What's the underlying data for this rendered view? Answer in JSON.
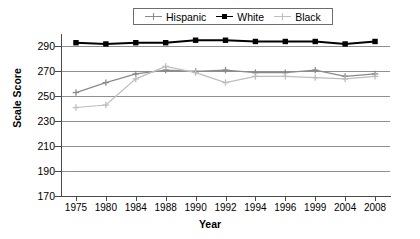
{
  "legend": {
    "position": "top-center",
    "entries": [
      {
        "label": "Hispanic",
        "color": "#8a8a8a",
        "marker": "plus"
      },
      {
        "label": "White",
        "color": "#000000",
        "marker": "square"
      },
      {
        "label": "Black",
        "color": "#bdbdbd",
        "marker": "plus"
      }
    ]
  },
  "axes": {
    "ylabel": "Scale Score",
    "xlabel": "Year",
    "yticks": [
      290,
      270,
      250,
      230,
      210,
      190,
      170
    ],
    "ylim": [
      170,
      300
    ],
    "grid": true
  },
  "chart_data": {
    "type": "line",
    "title": "",
    "xlabel": "Year",
    "ylabel": "Scale Score",
    "ylim": [
      170,
      300
    ],
    "yticks": [
      170,
      190,
      210,
      230,
      250,
      270,
      290
    ],
    "grid": true,
    "legend_position": "top-center",
    "categories": [
      "1975",
      "1980",
      "1984",
      "1988",
      "1990",
      "1992",
      "1994",
      "1996",
      "1999",
      "2004",
      "2008"
    ],
    "series": [
      {
        "name": "Hispanic",
        "color": "#8a8a8a",
        "marker": "plus",
        "values": [
          253,
          261,
          268,
          271,
          270,
          271,
          269,
          269,
          271,
          266,
          268
        ]
      },
      {
        "name": "White",
        "color": "#000000",
        "marker": "square",
        "values": [
          293,
          292,
          293,
          293,
          295,
          295,
          294,
          294,
          294,
          292,
          294
        ]
      },
      {
        "name": "Black",
        "color": "#bdbdbd",
        "marker": "plus",
        "values": [
          241,
          243,
          264,
          274,
          269,
          261,
          266,
          266,
          265,
          264,
          266
        ]
      }
    ]
  }
}
